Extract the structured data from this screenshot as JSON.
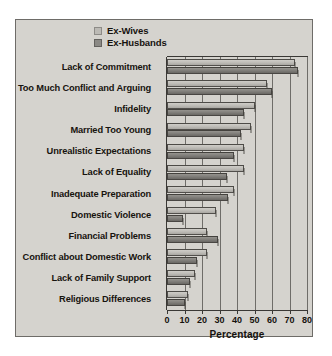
{
  "chart_data": {
    "type": "bar",
    "orientation": "horizontal",
    "title": "",
    "xlabel": "Percentage",
    "ylabel": "",
    "xlim": [
      0,
      80
    ],
    "xticks": [
      0,
      10,
      20,
      30,
      40,
      50,
      60,
      70,
      80
    ],
    "grid": true,
    "legend_position": "top",
    "categories": [
      "Lack of Commitment",
      "Too Much Conflict and Arguing",
      "Infidelity",
      "Married Too Young",
      "Unrealistic Expectations",
      "Lack of Equality",
      "Inadequate Preparation",
      "Domestic Violence",
      "Financial Problems",
      "Conflict about Domestic Work",
      "Lack of Family Support",
      "Religious Differences"
    ],
    "series": [
      {
        "name": "Ex-Wives",
        "color": "#bdbbb6",
        "values": [
          73,
          57,
          50,
          48,
          44,
          44,
          38,
          28,
          23,
          23,
          16,
          12
        ]
      },
      {
        "name": "Ex-Husbands",
        "color": "#7e7c78",
        "values": [
          75,
          60,
          44,
          42,
          38,
          34,
          35,
          9,
          29,
          17,
          13,
          10
        ]
      }
    ]
  },
  "legend": {
    "items": [
      {
        "label": "Ex-Wives"
      },
      {
        "label": "Ex-Husbands"
      }
    ]
  },
  "colors": {
    "panel_background": "#d5d3ce",
    "panel_border": "#6e6c68",
    "axis": "#3a3835",
    "gridline": "#6f6d69",
    "text": "#15120e"
  }
}
